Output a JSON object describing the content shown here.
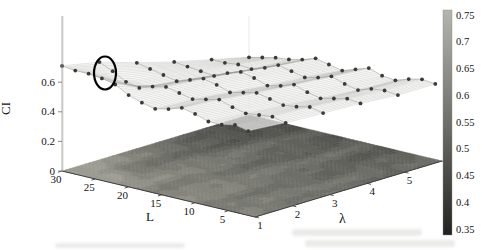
{
  "figure": {
    "background": "#ffffff",
    "kind": "scanned 3D surface figure"
  },
  "chart_data": {
    "type": "3d-mesh-surface-with-contour-projection",
    "xlabel": "L",
    "ylabel": "λ",
    "zlabel": "CI",
    "x_ticks": [
      "30",
      "25",
      "20",
      "15",
      "10",
      "5"
    ],
    "y_ticks": [
      "1",
      "2",
      "3",
      "4",
      "5",
      "6"
    ],
    "z_ticks": [
      "0",
      "0.2",
      "0.4",
      "0.6"
    ],
    "x_range": [
      30,
      1
    ],
    "y_range": [
      1,
      6
    ],
    "z_range": [
      0,
      1.05
    ],
    "L_samples": [
      30,
      28,
      26,
      24,
      22,
      20,
      18,
      16,
      14,
      12,
      10,
      8,
      6,
      4,
      2
    ],
    "series": [
      {
        "lambda": 1,
        "values": [
          0.71,
          0.7,
          0.7,
          0.69,
          0.67,
          0.62,
          0.59,
          0.57,
          0.59,
          0.62,
          0.6,
          0.57,
          0.57,
          0.59,
          0.57
        ]
      },
      {
        "lambda": 2,
        "values": [
          0.66,
          0.62,
          0.57,
          0.55,
          0.58,
          0.6,
          0.58,
          0.56,
          0.58,
          0.6,
          0.57,
          0.55,
          0.56,
          0.57,
          0.55
        ]
      },
      {
        "lambda": 3,
        "values": [
          0.58,
          0.56,
          0.54,
          0.52,
          0.55,
          0.58,
          0.56,
          0.53,
          0.55,
          0.57,
          0.55,
          0.53,
          0.54,
          0.56,
          0.54
        ]
      },
      {
        "lambda": 4,
        "values": [
          0.51,
          0.5,
          0.49,
          0.48,
          0.52,
          0.55,
          0.53,
          0.5,
          0.52,
          0.55,
          0.52,
          0.5,
          0.52,
          0.54,
          0.53
        ]
      },
      {
        "lambda": 5,
        "values": [
          0.45,
          0.45,
          0.46,
          0.45,
          0.48,
          0.52,
          0.5,
          0.48,
          0.5,
          0.53,
          0.5,
          0.48,
          0.51,
          0.52,
          0.51
        ]
      },
      {
        "lambda": 6,
        "values": [
          0.39,
          0.41,
          0.43,
          0.44,
          0.46,
          0.49,
          0.47,
          0.45,
          0.48,
          0.51,
          0.48,
          0.47,
          0.5,
          0.52,
          0.51
        ]
      }
    ],
    "colorbar": {
      "ticks": [
        "0.75",
        "0.7",
        "0.65",
        "0.6",
        "0.55",
        "0.5",
        "0.45",
        "0.4",
        "0.35"
      ],
      "vmin": 0.34,
      "vmax": 0.76,
      "color_low": "#222220",
      "color_high": "#b5b5b0"
    },
    "annotation": {
      "shape": "ellipse",
      "marks": "highlighted data point",
      "near_L": 23,
      "near_lambda": 1
    },
    "legend": "none",
    "grid": "faint 3d box edges",
    "colors": {
      "data_dot": "#3a3a38",
      "mesh_line": "#a5a5a0",
      "mesh_row_line": "#8c8c88",
      "mesh_fill": "rgba(250,250,248,0.72)",
      "axis_line": "#3f3f3f",
      "annotation_stroke": "#000000"
    }
  }
}
